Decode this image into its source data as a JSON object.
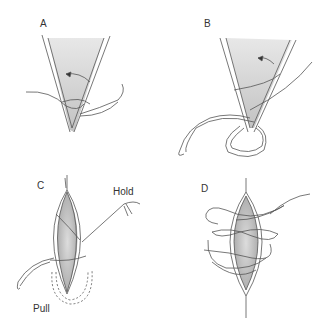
{
  "figure": {
    "panels": [
      {
        "id": "A",
        "label": "A",
        "description": "Needle passed through wound apex; arrow indicates direction"
      },
      {
        "id": "B",
        "label": "B",
        "description": "Suture looped around wound apex; arrow indicates direction"
      },
      {
        "id": "C",
        "label": "C",
        "description": "Running suture through elliptical wound",
        "annotations": [
          "Hold",
          "Pull"
        ]
      },
      {
        "id": "D",
        "label": "D",
        "description": "Completed looped suture around elliptical wound"
      }
    ],
    "colors": {
      "line": "#555555",
      "shade": "#bdbdbd",
      "background": "#ffffff"
    }
  }
}
